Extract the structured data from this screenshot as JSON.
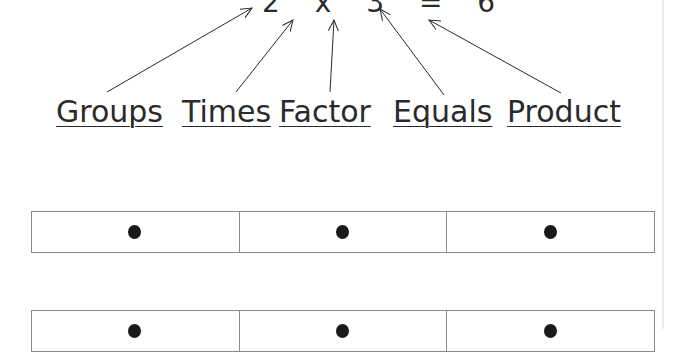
{
  "equation": {
    "text": "2 x 3 = 6",
    "parts": [
      "2",
      "x",
      "3",
      "=",
      "6"
    ]
  },
  "labels": [
    {
      "text": "Groups"
    },
    {
      "text": "Times"
    },
    {
      "text": "Factor"
    },
    {
      "text": "Equals"
    },
    {
      "text": "Product"
    }
  ],
  "rows": [
    {
      "cells": [
        "dot",
        "dot",
        "dot"
      ]
    },
    {
      "cells": [
        "dot",
        "dot",
        "dot"
      ]
    }
  ]
}
